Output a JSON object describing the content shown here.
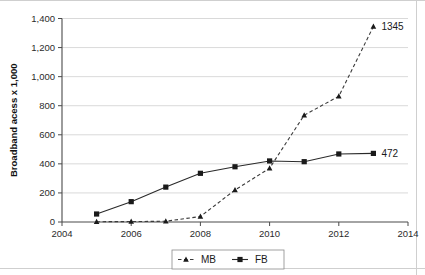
{
  "chart_data": {
    "type": "line",
    "title": "",
    "subtitle": "",
    "xlabel": "",
    "ylabel": "Broadband acess x 1,000",
    "x": [
      2005,
      2006,
      2007,
      2008,
      2009,
      2010,
      2011,
      2012,
      2013
    ],
    "xlim": [
      2004,
      2014
    ],
    "ylim": [
      0,
      1400
    ],
    "xticks": [
      2004,
      2006,
      2008,
      2010,
      2012,
      2014
    ],
    "xtick_labels": [
      "2004",
      "2006",
      "2008",
      "2010",
      "2012",
      "2014"
    ],
    "yticks": [
      0,
      200,
      400,
      600,
      800,
      1000,
      1200,
      1400
    ],
    "ytick_labels": [
      "0",
      "200",
      "400",
      "600",
      "800",
      "1,000",
      "1,200",
      "1,400"
    ],
    "grid": "horizontal",
    "legend_position": "bottom-center",
    "series": [
      {
        "name": "MB",
        "marker": "triangle",
        "line_style": "dashed",
        "color": "#2a2a2a",
        "values": [
          2,
          3,
          5,
          38,
          220,
          370,
          735,
          865,
          1345
        ],
        "end_label": "1345"
      },
      {
        "name": "FB",
        "marker": "square",
        "line_style": "solid",
        "color": "#2a2a2a",
        "values": [
          55,
          140,
          240,
          335,
          380,
          420,
          415,
          468,
          472
        ],
        "end_label": "472"
      }
    ],
    "annotations": [
      {
        "text": "1345",
        "series": "MB",
        "x": 2013,
        "y": 1345
      },
      {
        "text": "472",
        "series": "FB",
        "x": 2013,
        "y": 472
      }
    ]
  },
  "legend": {
    "items": [
      {
        "label": "MB",
        "marker": "triangle-marker",
        "line_style": "dashed"
      },
      {
        "label": "FB",
        "marker": "square-marker",
        "line_style": "solid"
      }
    ]
  },
  "axes": {
    "y_title": "Broadband acess x 1,000"
  }
}
